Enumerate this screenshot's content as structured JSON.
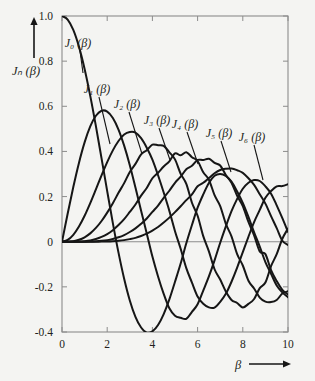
{
  "figure": {
    "background_color": "#f4f4f2",
    "ink_color": "#161616",
    "axis_color": "#8c8c8c"
  },
  "axes": {
    "y_axis_title": "Jₙ (β)",
    "y_axis_arrow": "up-arrow",
    "x_axis_title": "β",
    "x_axis_arrow": "right-arrow",
    "x_tick_labels": [
      "0",
      "2",
      "4",
      "6",
      "8",
      "10"
    ],
    "y_tick_labels": [
      "1.0",
      "0.8",
      "0.6",
      "0.4",
      "0.2",
      "0",
      "-0.2",
      "-0.4"
    ]
  },
  "curve_labels": [
    {
      "text": "J₀ (β)",
      "x": 78,
      "y": 47
    },
    {
      "text": "J₁ (β)",
      "x": 97,
      "y": 93
    },
    {
      "text": "J₂ (β)",
      "x": 127,
      "y": 108
    },
    {
      "text": "J₃ (β)",
      "x": 157,
      "y": 124
    },
    {
      "text": "J₄ (β)",
      "x": 185,
      "y": 128
    },
    {
      "text": "J₅ (β)",
      "x": 219,
      "y": 137
    },
    {
      "text": "J₆ (β)",
      "x": 252,
      "y": 141
    }
  ],
  "chart_data": {
    "type": "line",
    "title": "",
    "xlabel": "β",
    "ylabel": "Jₙ (β)",
    "xlim": [
      0,
      10
    ],
    "ylim": [
      -0.4,
      1.0
    ],
    "xticks": [
      0,
      2,
      4,
      6,
      8,
      10
    ],
    "yticks": [
      -0.4,
      -0.2,
      0,
      0.2,
      0.4,
      0.6,
      0.8,
      1.0
    ],
    "grid": false,
    "legend": "inline-curve-labels",
    "x": [
      0,
      0.25,
      0.5,
      0.75,
      1,
      1.25,
      1.5,
      1.75,
      2,
      2.25,
      2.5,
      2.75,
      3,
      3.25,
      3.5,
      3.75,
      4,
      4.25,
      4.5,
      4.75,
      5,
      5.25,
      5.5,
      5.75,
      6,
      6.25,
      6.5,
      6.75,
      7,
      7.25,
      7.5,
      7.75,
      8,
      8.25,
      8.5,
      8.75,
      9,
      9.25,
      9.5,
      9.75,
      10
    ],
    "series": [
      {
        "name": "J₀ (β)",
        "order": 0,
        "values": [
          1.0,
          0.9844,
          0.9385,
          0.8642,
          0.7652,
          0.6459,
          0.5118,
          0.369,
          0.2239,
          0.0827,
          -0.0484,
          -0.1641,
          -0.2601,
          -0.3325,
          -0.3801,
          -0.4026,
          -0.3971,
          -0.3691,
          -0.3205,
          -0.2556,
          -0.1776,
          -0.0968,
          -0.0068,
          0.074,
          0.1506,
          0.2095,
          0.2601,
          0.2921,
          0.3001,
          0.2912,
          0.2663,
          0.2225,
          0.1717,
          0.1096,
          0.0419,
          -0.0217,
          -0.0903,
          -0.1423,
          -0.1939,
          -0.2243,
          -0.2459
        ],
        "key_points": {
          "first_zero": 2.405,
          "first_min": {
            "x": 3.83,
            "y": -0.403
          },
          "second_max": {
            "x": 7.02,
            "y": 0.3001
          }
        }
      },
      {
        "name": "J₁ (β)",
        "order": 1,
        "values": [
          0.0,
          0.124,
          0.2423,
          0.3492,
          0.4401,
          0.5106,
          0.5579,
          0.5802,
          0.5767,
          0.5484,
          0.4971,
          0.4256,
          0.3391,
          0.24,
          0.1374,
          0.0366,
          -0.066,
          -0.1538,
          -0.2311,
          -0.2951,
          -0.3276,
          -0.3371,
          -0.3414,
          -0.311,
          -0.2767,
          -0.2163,
          -0.1538,
          -0.0825,
          -0.0047,
          0.0677,
          0.1352,
          0.19,
          0.2346,
          0.2614,
          0.2731,
          0.269,
          0.2453,
          0.2129,
          0.1613,
          0.1042,
          0.0435
        ],
        "key_points": {
          "max": {
            "x": 1.84,
            "y": 0.5819
          },
          "zero": 3.832,
          "min": {
            "x": 5.33,
            "y": -0.3461
          }
        }
      },
      {
        "name": "J₂ (β)",
        "order": 2,
        "values": [
          0.0,
          0.0078,
          0.0306,
          0.0671,
          0.1149,
          0.1711,
          0.2321,
          0.294,
          0.3528,
          0.4046,
          0.4461,
          0.4746,
          0.4861,
          0.4836,
          0.4586,
          0.4167,
          0.3641,
          0.2944,
          0.2178,
          0.1367,
          0.0466,
          -0.0315,
          -0.1173,
          -0.1812,
          -0.2429,
          -0.2749,
          -0.2911,
          -0.2917,
          -0.2663,
          -0.2309,
          -0.1773,
          -0.1147,
          -0.0462,
          0.022,
          0.0871,
          0.141,
          0.1947,
          0.2244,
          0.2453,
          0.2465,
          0.2546
        ],
        "key_points": {
          "max": {
            "x": 3.05,
            "y": 0.4861
          },
          "zero": 5.136,
          "min": {
            "x": 6.71,
            "y": -0.3014
          }
        }
      },
      {
        "name": "J₃ (β)",
        "order": 3,
        "values": [
          0.0,
          0.0003,
          0.0026,
          0.0085,
          0.0196,
          0.0369,
          0.061,
          0.0919,
          0.1289,
          0.1707,
          0.2166,
          0.2595,
          0.3091,
          0.3449,
          0.3868,
          0.4057,
          0.4302,
          0.4273,
          0.4247,
          0.3962,
          0.3648,
          0.3011,
          0.2561,
          0.1727,
          0.1148,
          0.0247,
          -0.0429,
          -0.122,
          -0.1676,
          -0.2209,
          -0.2581,
          -0.2715,
          -0.2911,
          -0.2756,
          -0.2538,
          -0.2054,
          -0.1809,
          -0.1084,
          -0.0552,
          0.0132,
          0.0584
        ],
        "key_points": {
          "max": {
            "x": 4.2,
            "y": 0.4302
          },
          "zero": 6.38
        }
      },
      {
        "name": "J₄ (β)",
        "order": 4,
        "values": [
          0.0,
          0.0,
          0.0002,
          0.0008,
          0.0025,
          0.0058,
          0.0118,
          0.0211,
          0.034,
          0.0512,
          0.0738,
          0.0998,
          0.132,
          0.165,
          0.2044,
          0.238,
          0.2811,
          0.3055,
          0.3335,
          0.3562,
          0.3912,
          0.3826,
          0.3967,
          0.3745,
          0.3576,
          0.3076,
          0.2748,
          0.2063,
          0.1578,
          0.0793,
          0.0238,
          -0.0548,
          -0.1054,
          -0.173,
          -0.2071,
          -0.2478,
          -0.2655,
          -0.2675,
          -0.2581,
          -0.2296,
          -0.2196
        ],
        "key_points": {
          "max": {
            "x": 5.32,
            "y": 0.3912
          },
          "zero": 7.59
        }
      },
      {
        "name": "J₅ (β)",
        "order": 5,
        "values": [
          0.0,
          0.0,
          0.0,
          0.0001,
          0.0002,
          0.0006,
          0.0018,
          0.0038,
          0.007,
          0.0123,
          0.0195,
          0.0295,
          0.043,
          0.0591,
          0.0793,
          0.1027,
          0.1321,
          0.1604,
          0.1947,
          0.2257,
          0.2611,
          0.288,
          0.3209,
          0.3361,
          0.3621,
          0.3621,
          0.3672,
          0.3494,
          0.3376,
          0.2957,
          0.2611,
          0.2036,
          0.1578,
          0.0875,
          0.0285,
          -0.0431,
          -0.055,
          -0.1259,
          -0.1743,
          -0.2134,
          -0.2341
        ],
        "key_points": {
          "max": {
            "x": 6.41,
            "y": 0.3621
          },
          "zero": 8.77
        }
      },
      {
        "name": "J₆ (β)",
        "order": 6,
        "values": [
          0.0,
          0.0,
          0.0,
          0.0,
          0.0,
          0.0001,
          0.0002,
          0.0006,
          0.0012,
          0.0024,
          0.0042,
          0.007,
          0.0114,
          0.017,
          0.0254,
          0.0355,
          0.0491,
          0.065,
          0.0851,
          0.1067,
          0.131,
          0.1572,
          0.184,
          0.2098,
          0.2458,
          0.2611,
          0.2821,
          0.3031,
          0.3179,
          0.3232,
          0.3242,
          0.3166,
          0.3051,
          0.281,
          0.2516,
          0.2102,
          0.1689,
          0.1134,
          0.0599,
          0.0041,
          -0.0145
        ],
        "key_points": {
          "max": {
            "x": 7.5,
            "y": 0.3242
          },
          "zero": 9.94
        }
      }
    ]
  }
}
